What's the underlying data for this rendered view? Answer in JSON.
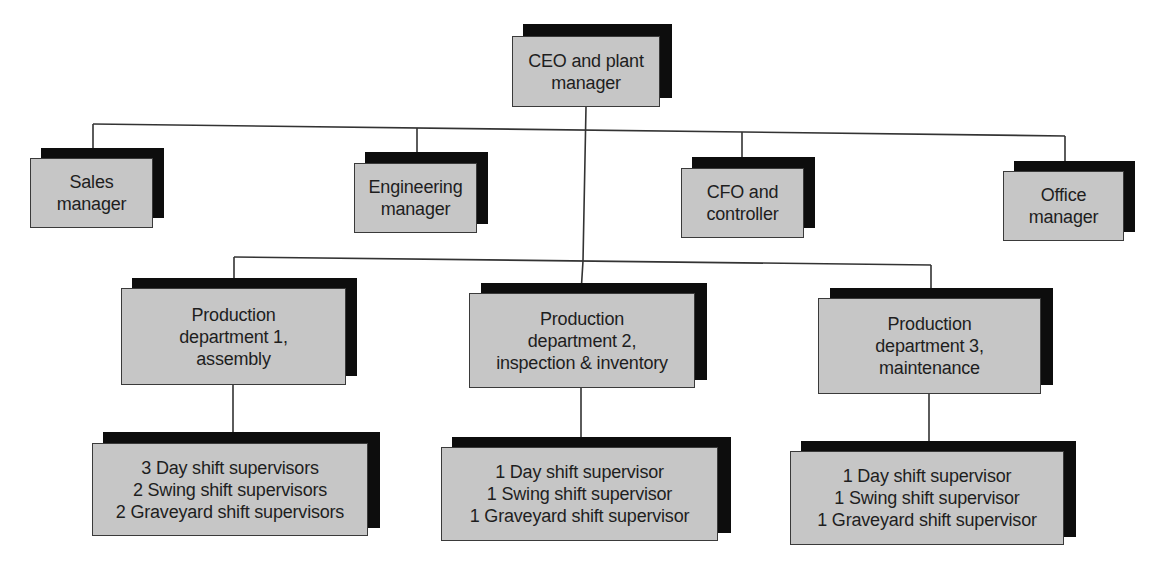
{
  "chart": {
    "type": "org-chart",
    "colors": {
      "box_fill": "#c6c6c6",
      "shadow": "#0d0d0d",
      "line": "#333333",
      "text": "#1e1e1e"
    },
    "root": {
      "id": "ceo",
      "lines": [
        "CEO and plant",
        "manager"
      ]
    },
    "staff": [
      {
        "id": "sales",
        "lines": [
          "Sales",
          "manager"
        ]
      },
      {
        "id": "engineering",
        "lines": [
          "Engineering",
          "manager"
        ]
      },
      {
        "id": "cfo",
        "lines": [
          "CFO and",
          "controller"
        ]
      },
      {
        "id": "office",
        "lines": [
          "Office",
          "manager"
        ]
      }
    ],
    "departments": [
      {
        "id": "prod1",
        "lines": [
          "Production",
          "department 1,",
          "assembly"
        ],
        "supervisors": [
          "3 Day shift supervisors",
          "2 Swing shift supervisors",
          "2 Graveyard shift supervisors"
        ]
      },
      {
        "id": "prod2",
        "lines": [
          "Production",
          "department 2,",
          "inspection & inventory"
        ],
        "supervisors": [
          "1 Day shift supervisor",
          "1 Swing shift supervisor",
          "1 Graveyard shift supervisor"
        ]
      },
      {
        "id": "prod3",
        "lines": [
          "Production",
          "department 3,",
          "maintenance"
        ],
        "supervisors": [
          "1 Day shift supervisor",
          "1 Swing shift supervisor",
          "1 Graveyard shift supervisor"
        ]
      }
    ]
  }
}
